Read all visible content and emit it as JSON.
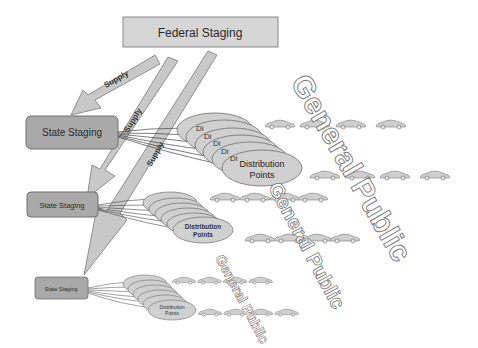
{
  "diagram": {
    "federal": {
      "label": "Federal Staging"
    },
    "supply_label": "Supply",
    "tiers": [
      {
        "state_label": "State Staging",
        "dp_title": "Distribution",
        "dp_sub": "Points",
        "dp_stub": "Di",
        "public_label": "General Public"
      },
      {
        "state_label": "State Staging",
        "dp_title": "Distribution",
        "dp_sub": "Points",
        "dp_stub": "Di",
        "public_label": "General Public"
      },
      {
        "state_label": "State Staging",
        "dp_title": "Distribution",
        "dp_sub": "Points",
        "dp_stub": "Di",
        "public_label": "General Public"
      }
    ],
    "colors": {
      "federal_fill": "#d6d6d6",
      "state_fill": "#a9a9a9",
      "arrow_fill": "#c8c8c8",
      "ellipse_fill": "#d0d0d0",
      "car_fill": "#cfcfcf",
      "outline": "#6e6e6e"
    }
  }
}
